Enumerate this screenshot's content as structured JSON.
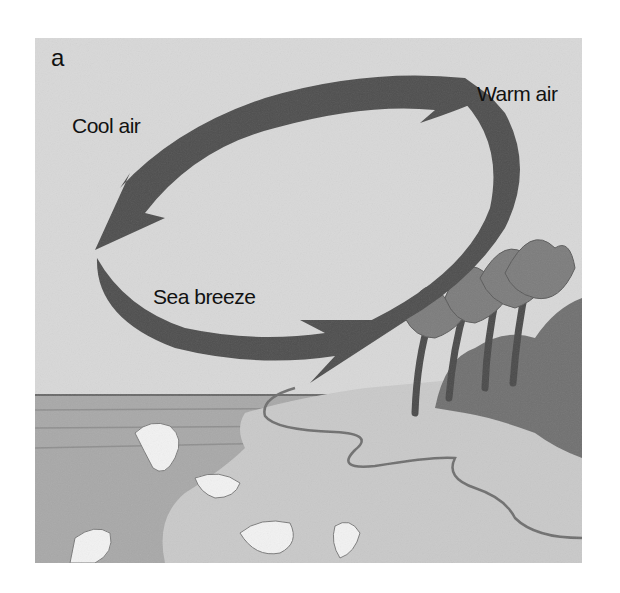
{
  "figure": {
    "panel_letter": "a",
    "labels": {
      "cool_air": "Cool air",
      "warm_air": "Warm air",
      "sea_breeze": "Sea breeze"
    },
    "elements": [
      "circulation-arrows",
      "ocean",
      "waves",
      "beach",
      "palm-trees",
      "shrubs"
    ],
    "colors": {
      "sky": "#d6d6d6",
      "arrow": "#4e4e4e",
      "sea": "#a9a9a9",
      "sand": "#c8c8c8",
      "vegetation": "#6e6e6e"
    }
  }
}
